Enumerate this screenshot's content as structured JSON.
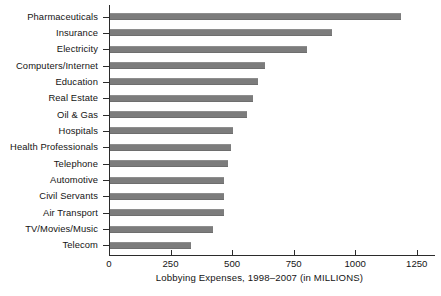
{
  "chart_data": {
    "type": "bar",
    "orientation": "horizontal",
    "title": "",
    "xlabel": "Lobbying Expenses, 1998–2007 (in MILLIONS)",
    "ylabel": "",
    "xlim": [
      0,
      1320
    ],
    "grid": false,
    "legend": null,
    "bar_color": "#7c7c7c",
    "axis_color": "#2b2b2b",
    "xticks": [
      0,
      250,
      500,
      750,
      1000,
      1250
    ],
    "xtick_labels": [
      "0",
      "250",
      "500",
      "750",
      "1000",
      "1250"
    ],
    "categories": [
      "Pharmaceuticals",
      "Insurance",
      "Electricity",
      "Computers/Internet",
      "Education",
      "Real Estate",
      "Oil & Gas",
      "Hospitals",
      "Health Professionals",
      "Telephone",
      "Automotive",
      "Civil Servants",
      "Air Transport",
      "TV/Movies/Music",
      "Telecom"
    ],
    "values": [
      1180,
      900,
      800,
      630,
      600,
      580,
      555,
      500,
      490,
      480,
      465,
      465,
      465,
      420,
      330
    ]
  }
}
